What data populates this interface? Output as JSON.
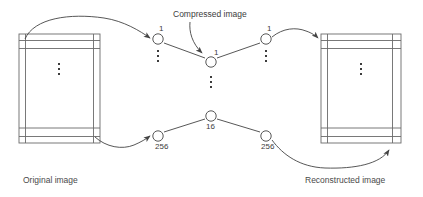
{
  "figure": {
    "type": "neural-network-autoencoder-diagram",
    "background_color": "#ffffff",
    "line_color": "#555555",
    "text_color": "#4a4a4a"
  },
  "captions": {
    "original_image": "Original image",
    "reconstructed_image": "Reconstructed image",
    "compressed_image": "Compressed image"
  },
  "layers": {
    "input_encoder": {
      "top_label": "1",
      "bottom_label": "256"
    },
    "bottleneck": {
      "top_label": "1",
      "bottom_label": "16"
    },
    "output_decoder": {
      "top_label": "1",
      "bottom_label": "256"
    }
  },
  "nodes": [
    {
      "name": "encoder-top-node",
      "label": "1",
      "cx": 158,
      "cy": 39
    },
    {
      "name": "encoder-bottom-node",
      "label": "256",
      "cx": 158,
      "cy": 136
    },
    {
      "name": "bottleneck-top-node",
      "label": "1",
      "cx": 211,
      "cy": 62
    },
    {
      "name": "bottleneck-bottom-node",
      "label": "16",
      "cx": 211,
      "cy": 116
    },
    {
      "name": "decoder-top-node",
      "label": "1",
      "cx": 266,
      "cy": 39
    },
    {
      "name": "decoder-bottom-node",
      "label": "256",
      "cx": 266,
      "cy": 136
    }
  ],
  "image_blocks": {
    "original": {
      "x": 19,
      "y": 34,
      "w": 81,
      "h": 109
    },
    "reconstructed": {
      "x": 321,
      "y": 34,
      "w": 80,
      "h": 109
    }
  },
  "ellipsis": {
    "glyph": "vertical-dots"
  }
}
